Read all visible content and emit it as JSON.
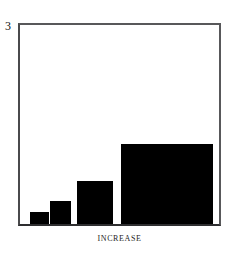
{
  "figure": {
    "background_color": "#ffffff",
    "frame_color": "#4a4a4c",
    "bar_color": "#000000"
  },
  "axes": {
    "y_top_label": "3",
    "x_caption": "INCREASE"
  },
  "chart_data": {
    "type": "bar",
    "title": "",
    "xlabel": "INCREASE",
    "ylabel": "",
    "categories": [
      "1",
      "2",
      "3",
      "4"
    ],
    "values": [
      0.18,
      0.34,
      0.65,
      1.21
    ],
    "bar_widths": [
      0.2,
      0.21,
      0.37,
      0.94
    ],
    "ylim": [
      0,
      3
    ],
    "xlim": [
      0,
      2.03
    ],
    "ytick_labels": [
      "3"
    ],
    "xtick_labels": [],
    "grid": false,
    "legend": false,
    "bar_color": "#000000"
  }
}
